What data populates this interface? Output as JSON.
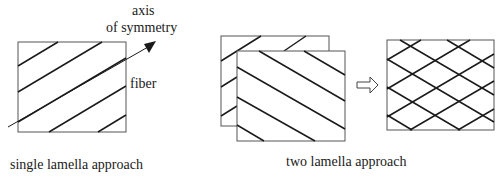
{
  "labels": {
    "axis_line1": "axis",
    "axis_line2": "of symmetry",
    "fiber": "fiber",
    "single_caption": "single lamella approach",
    "two_caption": "two lamella approach"
  },
  "colors": {
    "line": "#1a1a1a",
    "frame": "#555555",
    "background": "#ffffff"
  }
}
